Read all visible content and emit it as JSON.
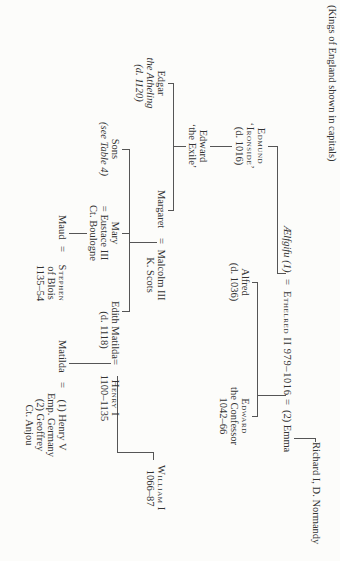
{
  "table": {
    "caption": "(Kings of England shown in capitals)",
    "people": {
      "richard": "Richard I, D. Normandy",
      "aelfgifu": "Ælfgifu (1)",
      "eq1": "=",
      "ethelred": "Ethelred II 979–1016",
      "eq2": "=",
      "emma": "(2) Emma",
      "edmund": [
        "Edmund",
        "‘Ironside’",
        "(d. 1016)"
      ],
      "alfred": [
        "Alfred",
        "(d. 1036)"
      ],
      "edward_confessor": [
        "Edward",
        "the Confessor",
        "1042–66"
      ],
      "edward_exile": [
        "Edward",
        "‘the Exile’"
      ],
      "edgar": [
        "Edgar",
        "the Atheling",
        "(d. 1120)"
      ],
      "margaret": "Margaret",
      "eq3": "=",
      "malcolm": [
        "Malcolm III",
        "K. Scots"
      ],
      "sons": [
        "Sons",
        "(see Table 4)"
      ],
      "mary": [
        "Mary",
        "= Eustace III",
        "Ct. Boulogne"
      ],
      "edith": [
        "Edith Matilda",
        "(d. 1118)"
      ],
      "eq4": "=",
      "henry1": [
        "Henry I",
        "1100–1135"
      ],
      "william1": [
        "William I",
        "1066–87"
      ],
      "maud": "Maud",
      "eq5": "=",
      "stephen": [
        "Stephen",
        "of Blois",
        "1135–54"
      ],
      "matilda": "Matilda",
      "eq6": "=",
      "henry5": [
        "(1) Henry V",
        "Emp. Germany",
        "(2) Geoffrey",
        "Ct. Anjou"
      ]
    }
  }
}
